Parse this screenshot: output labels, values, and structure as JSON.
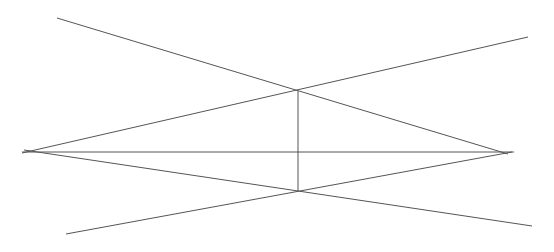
{
  "diagram": {
    "width": 554,
    "height": 252,
    "background": "#ffffff",
    "stroke_color": "#555555",
    "lines": [
      {
        "name": "line-upper-left-to-right-vertex",
        "x1": 57,
        "y1": 18,
        "x2": 508,
        "y2": 154
      },
      {
        "name": "line-upper-right-to-left-vertex",
        "x1": 528,
        "y1": 37,
        "x2": 22,
        "y2": 153
      },
      {
        "name": "line-lower-left-to-right-vertex",
        "x1": 66,
        "y1": 234,
        "x2": 512,
        "y2": 152
      },
      {
        "name": "line-lower-right-to-left-vertex",
        "x1": 532,
        "y1": 226,
        "x2": 24,
        "y2": 150
      },
      {
        "name": "horizontal-axis-line",
        "x1": 22,
        "y1": 152,
        "x2": 514,
        "y2": 152
      },
      {
        "name": "vertical-line",
        "x1": 298,
        "y1": 91,
        "x2": 298,
        "y2": 191
      }
    ]
  }
}
